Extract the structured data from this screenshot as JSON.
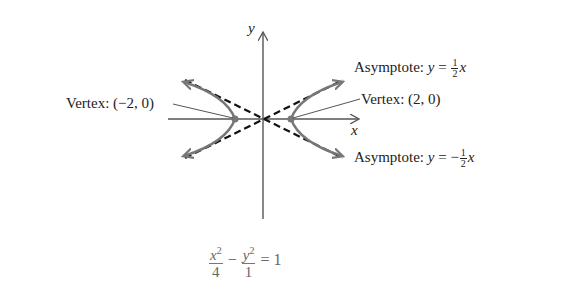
{
  "axes": {
    "x_label": "x",
    "y_label": "y"
  },
  "labels": {
    "asymptote_pos": {
      "prefix": "Asymptote: ",
      "var": "y",
      "eq": " = ",
      "sign": "",
      "num": "1",
      "den": "2",
      "xvar": "x"
    },
    "asymptote_neg": {
      "prefix": "Asymptote: ",
      "var": "y",
      "eq": " = ",
      "sign": "−",
      "num": "1",
      "den": "2",
      "xvar": "x"
    },
    "vertex_left": "Vertex: (−2, 0)",
    "vertex_right": "Vertex: (2, 0)"
  },
  "equation": {
    "x_var": "x",
    "x_exp": "2",
    "x_den": "4",
    "minus": "−",
    "y_var": "y",
    "y_exp": "2",
    "y_den": "1",
    "rhs": "= 1"
  },
  "colors": {
    "curve": "#777777",
    "asymptote": "#111111",
    "axis": "#555555"
  }
}
